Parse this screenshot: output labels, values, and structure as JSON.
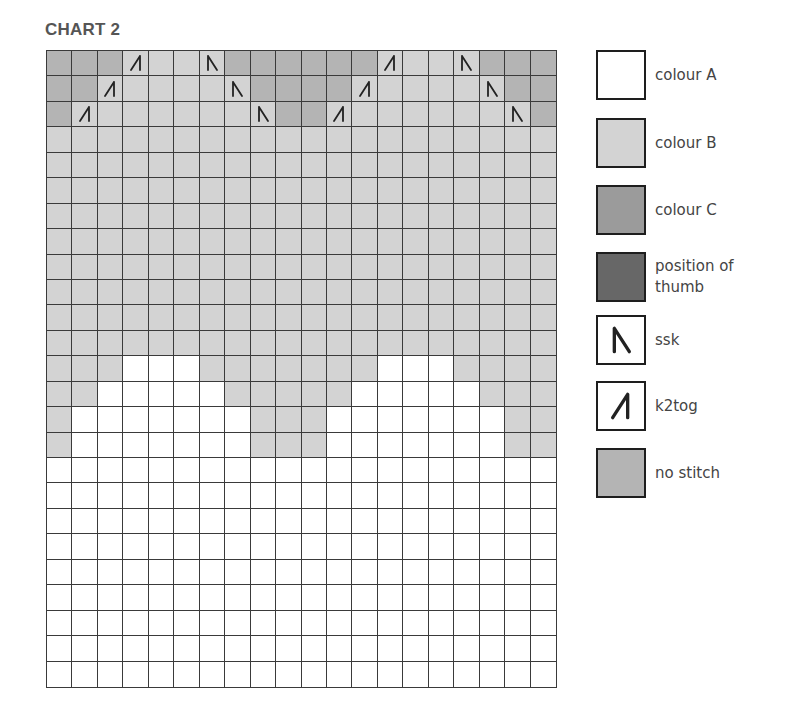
{
  "title": "CHART 2",
  "colors": {
    "A": "#ffffff",
    "B": "#d3d3d3",
    "C": "#9b9b9b",
    "T": "#676767",
    "N": "#b4b4b4",
    "grid_line": "#3a3a3a",
    "symbol": "#222222"
  },
  "legend": [
    {
      "key": "A",
      "label": "colour A",
      "swatch": "A",
      "symbol": null,
      "top": 0
    },
    {
      "key": "B",
      "label": "colour B",
      "swatch": "B",
      "symbol": null,
      "top": 68
    },
    {
      "key": "C",
      "label": "colour C",
      "swatch": "C",
      "symbol": null,
      "top": 135
    },
    {
      "key": "T",
      "label": "position of thumb",
      "swatch": "T",
      "symbol": null,
      "top": 202
    },
    {
      "key": "S",
      "label": "ssk",
      "swatch": "A",
      "symbol": "ssk",
      "top": 265
    },
    {
      "key": "K",
      "label": "k2tog",
      "swatch": "A",
      "symbol": "k2tog",
      "top": 331
    },
    {
      "key": "N",
      "label": "no stitch",
      "swatch": "N",
      "symbol": null,
      "top": 398
    }
  ],
  "chart_data": {
    "type": "heatmap",
    "title": "CHART 2",
    "columns": 20,
    "rows": 25,
    "row_order": "top-to-bottom",
    "cell_codes": {
      "A": "colour A",
      "B": "colour B",
      "C": "colour C",
      "T": "position of thumb",
      "S": "ssk (on colour B)",
      "K": "k2tog (on colour B)",
      "N": "no stitch"
    },
    "grid": [
      "NNNKBBSNNNNNNKBBSNNN",
      "NNKBBBBSNNNNKBBBBSNN",
      "NKBBBBBBSNNKBBBBBBSN",
      "BBBBBBBBBBBBBBBBBBBB",
      "BBBBBBBBBBBBBBBBBBBB",
      "BBBBBBBBBBBBBBBBBBBB",
      "BBBBBBBBBBBBBBBBBBBB",
      "BBBBBBBBBBBBBBBBBBBB",
      "BBBBBBBBBBBBBBBBBBBB",
      "BBBBBBBBBBBBBBBBBBBB",
      "BBBBBBBBBBBBBBBBBBBB",
      "BBBBBBBBBBBBBBBBBBBB",
      "BBBAAABBBBBBBAAABBBB",
      "BBAAAAABBBBBAAAAABBB",
      "BAAAAAAABBBAAAAAAABB",
      "BAAAAAAABBBAAAAAAABB",
      "AAAAAAAAAAAAAAAAAAAA",
      "AAAAAAAAAAAAAAAAAAAA",
      "AAAAAAAAAAAAAAAAAAAA",
      "AAAAAAAAAAAAAAAAAAAA",
      "AAAAAAAAAAAAAAAAAAAA",
      "AAAAAAAAAAAAAAAAAAAA",
      "AAAAAAAAAAAAAAAAAAAA",
      "AAAAAAAAAAAAAAAAAAAA",
      "AAAAAAAAAAAAAAAAAAAA"
    ],
    "legend_position": "right"
  }
}
